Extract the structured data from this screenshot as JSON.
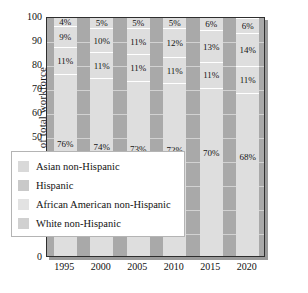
{
  "chart_data": {
    "type": "bar",
    "subtype": "stacked-100-percent",
    "title": "",
    "xlabel": "",
    "ylabel": "Percent of total workforce",
    "ylim": [
      0,
      100
    ],
    "ytick_labels": [
      "0",
      "10",
      "20",
      "30",
      "40",
      "50",
      "60",
      "70",
      "80",
      "90",
      "100"
    ],
    "ytick_values": [
      0,
      10,
      20,
      30,
      40,
      50,
      60,
      70,
      80,
      90,
      100
    ],
    "grid": true,
    "legend_position": "lower-left-overlay",
    "categories": [
      "1995",
      "2000",
      "2005",
      "2010",
      "2015",
      "2020"
    ],
    "series": [
      {
        "name": "White non-Hispanic",
        "values": [
          76,
          74,
          73,
          72,
          70,
          68
        ],
        "labels": [
          "76%",
          "74%",
          "73%",
          "72%",
          "70%",
          "68%"
        ],
        "color": "#dedede"
      },
      {
        "name": "African American non-Hispanic",
        "values": [
          11,
          11,
          11,
          11,
          11,
          11
        ],
        "labels": [
          "11%",
          "11%",
          "11%",
          "11%",
          "11%",
          "11%"
        ],
        "color": "#dedede"
      },
      {
        "name": "Hispanic",
        "values": [
          9,
          10,
          11,
          12,
          13,
          14
        ],
        "labels": [
          "9%",
          "10%",
          "11%",
          "12%",
          "13%",
          "14%"
        ],
        "color": "#dedede"
      },
      {
        "name": "Asian non-Hispanic",
        "values": [
          4,
          5,
          5,
          5,
          6,
          6
        ],
        "labels": [
          "4%",
          "5%",
          "5%",
          "5%",
          "6%",
          "6%"
        ],
        "color": "#dedede"
      }
    ]
  },
  "legend": {
    "entries": [
      {
        "label": "Asian non-Hispanic",
        "swatch": "#d9d9d9"
      },
      {
        "label": "Hispanic",
        "swatch": "#c9c9c9"
      },
      {
        "label": "African American non-Hispanic",
        "swatch": "#e2e2e2"
      },
      {
        "label": "White non-Hispanic",
        "swatch": "#d0d0d0"
      }
    ]
  },
  "colors": {
    "plot_background": "#a9a9a9",
    "bar_fill": "#dedede",
    "gridline": "#d2d2d2",
    "frame": "#2e2e2e",
    "text": "#111111"
  }
}
